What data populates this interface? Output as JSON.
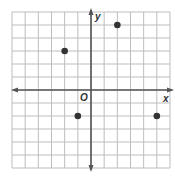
{
  "chart_data": {
    "type": "scatter",
    "title": "",
    "xlabel": "x",
    "ylabel": "y",
    "origin_label": "O",
    "xlim": [
      -6,
      6
    ],
    "ylim": [
      -6,
      6
    ],
    "grid": true,
    "tick_labels": false,
    "points": [
      {
        "x": -2,
        "y": 3
      },
      {
        "x": 2,
        "y": 5
      },
      {
        "x": -1,
        "y": -2
      },
      {
        "x": 5,
        "y": -2
      }
    ]
  },
  "colors": {
    "grid": "#bdbdbd",
    "axis": "#555555",
    "point": "#333333"
  }
}
